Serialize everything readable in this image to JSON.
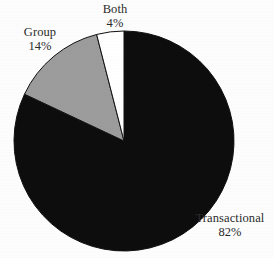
{
  "chart_data": {
    "type": "pie",
    "title": "",
    "categories": [
      "Transactional",
      "Group",
      "Both"
    ],
    "values": [
      82,
      14,
      4
    ],
    "value_unit": "%",
    "labels": [
      {
        "name": "Transactional",
        "percent": "82%",
        "value": 82,
        "color": "#0d0d0d"
      },
      {
        "name": "Group",
        "percent": "14%",
        "value": 14,
        "color": "#9c9c9c"
      },
      {
        "name": "Both",
        "percent": "4%",
        "value": 4,
        "color": "#ffffff"
      }
    ],
    "legend": "none",
    "grid": false,
    "start_angle_deg": 0,
    "direction": "clockwise",
    "geometry": {
      "center_x": 124,
      "center_y": 141,
      "radius": 110
    },
    "colors": {
      "transactional": "#0d0d0d",
      "group": "#9c9c9c",
      "both": "#ffffff",
      "outline": "#101010",
      "background": "#fdfdfd",
      "label_text": "#2b2b2b"
    }
  }
}
